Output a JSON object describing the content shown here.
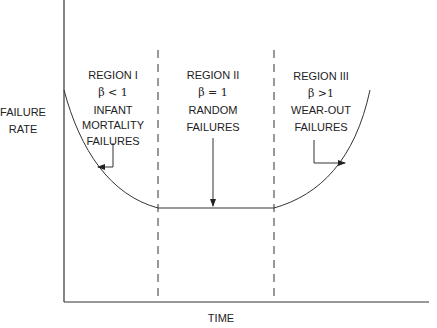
{
  "diagram": {
    "y_axis_label": [
      "FAILURE",
      "RATE"
    ],
    "x_axis_label": "TIME",
    "regions": [
      {
        "name": "REGION I",
        "beta": "β < 1",
        "description": [
          "INFANT",
          "MORTALITY",
          "FAILURES"
        ]
      },
      {
        "name": "REGION II",
        "beta": "β = 1",
        "description": [
          "RANDOM",
          "FAILURES"
        ]
      },
      {
        "name": "REGION III",
        "beta": "β >1",
        "description": [
          "WEAR-OUT",
          "FAILURES"
        ]
      }
    ],
    "colors": {
      "line": "#333333",
      "text": "#222222",
      "background": "#ffffff"
    }
  }
}
